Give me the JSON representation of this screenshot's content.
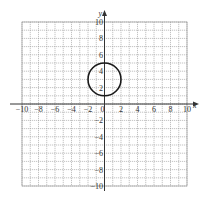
{
  "chart_data": {
    "type": "line",
    "title": "",
    "xlabel": "x",
    "ylabel": "y",
    "xlim": [
      -10,
      10
    ],
    "ylim": [
      -10,
      10
    ],
    "grid": true,
    "grid_step": 1,
    "x_ticks": [
      -10,
      -8,
      -6,
      -4,
      -2,
      0,
      2,
      4,
      6,
      8,
      10
    ],
    "x_tick_labels": [
      "−10",
      "−8",
      "−6",
      "−4",
      "−2",
      "0",
      "2",
      "4",
      "6",
      "8",
      "10"
    ],
    "y_ticks": [
      10,
      8,
      6,
      4,
      2,
      -2,
      -4,
      -6,
      -8,
      -10
    ],
    "y_tick_labels": [
      "10",
      "8",
      "6",
      "4",
      "2",
      "−2",
      "−4",
      "−6",
      "−8",
      "−10"
    ],
    "series": [
      {
        "name": "circle",
        "shape": "circle",
        "center": [
          0,
          3
        ],
        "radius": 2,
        "color": "#1a1a1a"
      }
    ],
    "legend": "none"
  },
  "layout": {
    "px_left": 22,
    "px_right": 187,
    "px_top": 22,
    "px_bottom": 186
  },
  "colors": {
    "grid": "#9a9a9a",
    "axis": "#333333",
    "curve": "#1a1a1a"
  }
}
